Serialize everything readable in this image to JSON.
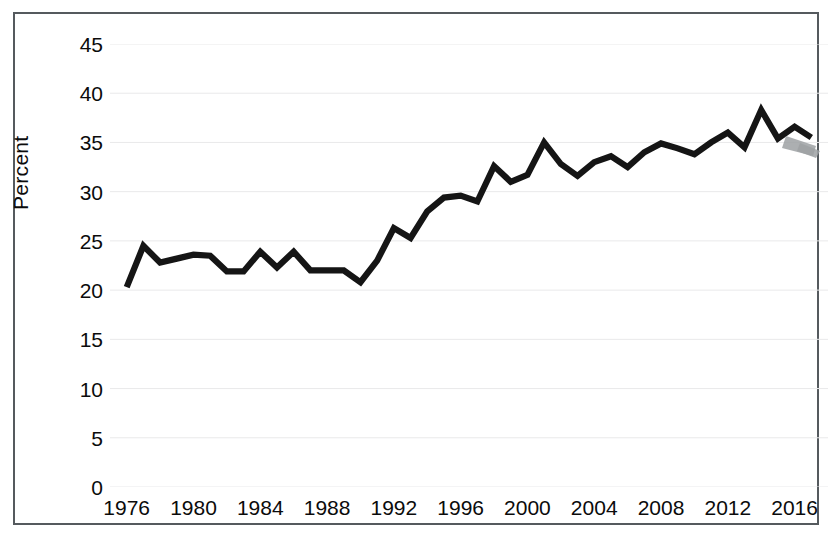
{
  "chart_data": {
    "type": "line",
    "title": "",
    "xlabel": "",
    "ylabel": "Percent",
    "xlim": [
      1975,
      2018
    ],
    "ylim": [
      0,
      45
    ],
    "ytick_step": 5,
    "xtick_step": 4,
    "grid": true,
    "legend": "none",
    "line_color": "#151515",
    "gridline_color": "#e9e9ea",
    "frame_color": "#555a5e",
    "ytick_labels": [
      "45",
      "40",
      "35",
      "30",
      "25",
      "20",
      "15",
      "10",
      "5",
      "0"
    ],
    "ytick_values": [
      45,
      40,
      35,
      30,
      25,
      20,
      15,
      10,
      5,
      0
    ],
    "xtick_labels": [
      "1976",
      "1980",
      "1984",
      "1988",
      "1992",
      "1996",
      "2000",
      "2004",
      "2008",
      "2012",
      "2016"
    ],
    "xtick_values": [
      1976,
      1980,
      1984,
      1988,
      1992,
      1996,
      2000,
      2004,
      2008,
      2012,
      2016
    ],
    "x": [
      1976,
      1977,
      1978,
      1979,
      1980,
      1981,
      1982,
      1983,
      1984,
      1985,
      1986,
      1987,
      1988,
      1989,
      1990,
      1991,
      1992,
      1993,
      1994,
      1995,
      1996,
      1997,
      1998,
      1999,
      2000,
      2001,
      2002,
      2003,
      2004,
      2005,
      2006,
      2007,
      2008,
      2009,
      2010,
      2011,
      2012,
      2013,
      2014,
      2015,
      2016,
      2017
    ],
    "values": [
      20.3,
      24.5,
      22.8,
      23.2,
      23.6,
      23.5,
      21.9,
      21.9,
      23.9,
      22.3,
      23.9,
      22.0,
      22.0,
      22.0,
      20.8,
      23.0,
      26.3,
      25.3,
      28.0,
      29.4,
      29.6,
      29.0,
      32.6,
      31.0,
      31.7,
      35.0,
      32.8,
      31.6,
      33.0,
      33.6,
      32.5,
      34.0,
      34.9,
      34.4,
      33.8,
      35.0,
      36.0,
      34.5,
      38.3,
      35.4,
      36.6,
      35.5
    ],
    "series_name": "Percent",
    "annotations": [
      {
        "name": "ink-smudge",
        "note": "gray scanner smudge over final segment near 2016-2017"
      }
    ]
  }
}
